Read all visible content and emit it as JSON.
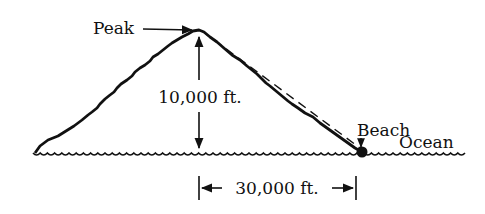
{
  "diagram": {
    "labels": {
      "peak": "Peak",
      "height": "10,000 ft.",
      "beach": "Beach",
      "ocean": "Ocean",
      "distance": "30,000 ft."
    },
    "quantities": {
      "height_ft": 10000,
      "horizontal_distance_ft": 30000
    },
    "colors": {
      "ink": "#111111",
      "background": "#ffffff"
    }
  }
}
